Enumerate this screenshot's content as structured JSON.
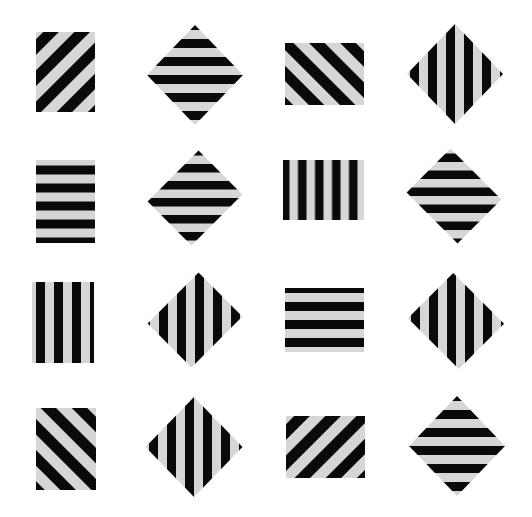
{
  "figure": {
    "colors": {
      "dark": "#0a0a0a",
      "light": "#d6d6d6",
      "background": "#ffffff"
    },
    "items": [
      {
        "row": 1,
        "col": 1,
        "shape": "rect",
        "x": 36,
        "y": 32,
        "w": 59,
        "h": 80,
        "rotate": 0,
        "stripe_angle": -45,
        "period": 22
      },
      {
        "row": 1,
        "col": 2,
        "shape": "diamond",
        "cx": 195,
        "cy": 75,
        "w": 96,
        "h": 100,
        "stripe_angle": 0,
        "period": 18
      },
      {
        "row": 1,
        "col": 3,
        "shape": "rect",
        "x": 285,
        "y": 43,
        "w": 79,
        "h": 62,
        "rotate": 0,
        "stripe_angle": 45,
        "period": 22
      },
      {
        "row": 1,
        "col": 4,
        "shape": "diamond",
        "cx": 455,
        "cy": 74,
        "w": 96,
        "h": 100,
        "stripe_angle": 90,
        "period": 18
      },
      {
        "row": 2,
        "col": 1,
        "shape": "rect",
        "x": 36,
        "y": 160,
        "w": 59,
        "h": 83,
        "rotate": 0,
        "stripe_angle": 0,
        "period": 18
      },
      {
        "row": 2,
        "col": 2,
        "shape": "rect",
        "cx": 195,
        "cy": 198,
        "w": 72,
        "h": 62,
        "rotate": -45,
        "stripe_angle": 90,
        "period": 17
      },
      {
        "row": 2,
        "col": 3,
        "shape": "rect",
        "x": 283,
        "y": 160,
        "w": 81,
        "h": 60,
        "rotate": 0,
        "stripe_angle": 90,
        "period": 17
      },
      {
        "row": 2,
        "col": 4,
        "shape": "rect",
        "cx": 454,
        "cy": 196,
        "w": 72,
        "h": 62,
        "rotate": 45,
        "stripe_angle": 90,
        "period": 17
      },
      {
        "row": 3,
        "col": 1,
        "shape": "rect",
        "x": 32,
        "y": 282,
        "w": 62,
        "h": 81,
        "rotate": 0,
        "stripe_angle": 90,
        "period": 18
      },
      {
        "row": 3,
        "col": 2,
        "shape": "rect",
        "cx": 195,
        "cy": 320,
        "w": 72,
        "h": 62,
        "rotate": -45,
        "stripe_angle": 0,
        "period": 18
      },
      {
        "row": 3,
        "col": 3,
        "shape": "rect",
        "x": 285,
        "y": 288,
        "w": 79,
        "h": 64,
        "rotate": 0,
        "stripe_angle": 0,
        "period": 18
      },
      {
        "row": 3,
        "col": 4,
        "shape": "rect",
        "cx": 456,
        "cy": 321,
        "w": 72,
        "h": 64,
        "rotate": 45,
        "stripe_angle": 0,
        "period": 18
      },
      {
        "row": 4,
        "col": 1,
        "shape": "rect",
        "x": 36,
        "y": 408,
        "w": 60,
        "h": 82,
        "rotate": 0,
        "stripe_angle": 45,
        "period": 22
      },
      {
        "row": 4,
        "col": 2,
        "shape": "diamond",
        "cx": 194,
        "cy": 447,
        "w": 97,
        "h": 100,
        "stripe_angle": 90,
        "period": 18
      },
      {
        "row": 4,
        "col": 3,
        "shape": "rect",
        "x": 286,
        "y": 416,
        "w": 79,
        "h": 62,
        "rotate": 0,
        "stripe_angle": -45,
        "period": 22
      },
      {
        "row": 4,
        "col": 4,
        "shape": "diamond",
        "cx": 457,
        "cy": 446,
        "w": 96,
        "h": 100,
        "stripe_angle": 0,
        "period": 18
      }
    ]
  }
}
